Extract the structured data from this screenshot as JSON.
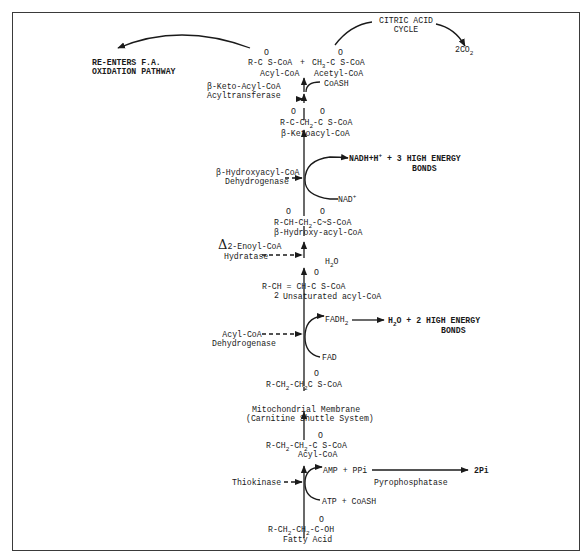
{
  "diagram": {
    "top": {
      "reenters_line1": "RE-ENTERS F.A.",
      "reenters_line2": "OXIDATION PATHWAY",
      "citric_line1": "CITRIC ACID",
      "citric_line2": "CYCLE",
      "co2": "2CO",
      "co2_sub": "2",
      "acyl_formula_a": "R-C S-CoA",
      "plus": "+",
      "acetyl_formula_a": "CH",
      "acetyl_formula_sub": "3",
      "acetyl_formula_b": "-C S-CoA",
      "acyl_name": "Acyl-CoA",
      "acetyl_name": "Acetyl-CoA",
      "carbonyl": "O"
    },
    "steps": [
      {
        "enzyme_line1": "β-Keto-Acyl-CoA",
        "enzyme_line2": "Acyltransferase",
        "cofactor_in": "CoASH"
      },
      {
        "formula": "R-C-CH",
        "formula_sub": "2",
        "formula_tail": "-C S-CoA",
        "name": "β-Ketoacyl-CoA"
      },
      {
        "enzyme_line1": "β-Hydroxyacyl-CoA",
        "enzyme_line2": "Dehydrogenase",
        "product_out": "NADH+H",
        "product_sup": "+",
        "energy_line1": "+ 3 HIGH ENERGY",
        "energy_line2": "BONDS",
        "cofactor_in": "NAD",
        "cofactor_sup": "+"
      },
      {
        "formula": "R-CH-CH",
        "formula_sub": "2",
        "formula_tail": "-C~S-CoA",
        "name": "β-Hydroxy-acyl-CoA"
      },
      {
        "enzyme_delta": "Δ",
        "enzyme_line1": "2-Enoyl-CoA",
        "enzyme_line2": "Hydratase",
        "water": "H",
        "water_sub": "2",
        "water_tail": "O"
      },
      {
        "formula": "R-CH = CH-C S-CoA",
        "formula_sub": "2",
        "name": "Unsaturated acyl-CoA"
      },
      {
        "enzyme_line1": "Acyl-CoA",
        "enzyme_line2": "Dehydrogenase",
        "product_out": "FADH",
        "product_sub": "2",
        "energy_water": "H",
        "energy_water_sub": "2",
        "energy_line1": "O + 2 HIGH ENERGY",
        "energy_line2": "BONDS",
        "cofactor_in": "FAD"
      },
      {
        "formula": "R-CH",
        "formula_sub1": "2",
        "formula_mid": "-CH",
        "formula_sub2": "2",
        "formula_tail": "C  S-CoA"
      },
      {
        "membrane_line1": "Mitochondrial Membrane",
        "membrane_line2": "(Carnitine Shuttle System)"
      },
      {
        "formula": "R-CH",
        "formula_sub1": "2",
        "formula_mid": "-CH",
        "formula_sub2": "2",
        "formula_tail": "-C S-CoA",
        "name": "Acyl-CoA"
      },
      {
        "enzyme_line1": "Thiokinase",
        "product_out": "AMP + PPi",
        "side_product": "2Pi",
        "side_enzyme": "Pyrophosphatase",
        "cofactor_in": "ATP + CoASH"
      },
      {
        "formula": "R-CH",
        "formula_sub1": "2",
        "formula_mid": "-CH",
        "formula_sub2": "2",
        "formula_tail": "-C-OH",
        "name": "Fatty Acid"
      }
    ]
  }
}
